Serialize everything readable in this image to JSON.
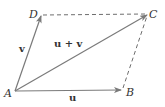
{
  "diagram": {
    "colors": {
      "vector": "#7a7a7a",
      "dashed": "#6e6e6e",
      "text": "#333333",
      "background": "#ffffff"
    },
    "points": {
      "A": {
        "label": "A",
        "x": 15,
        "y": 91
      },
      "B": {
        "label": "B",
        "x": 122,
        "y": 90
      },
      "C": {
        "label": "C",
        "x": 148,
        "y": 14
      },
      "D": {
        "label": "D",
        "x": 41,
        "y": 15
      }
    },
    "vectors": [
      {
        "name": "u",
        "label": "u",
        "from": "A",
        "to": "B",
        "style": "solid-arrow"
      },
      {
        "name": "v",
        "label": "v",
        "from": "A",
        "to": "D",
        "style": "solid-arrow"
      },
      {
        "name": "u+v",
        "label": "u + v",
        "from": "A",
        "to": "C",
        "style": "solid-arrow"
      }
    ],
    "dashed_edges": [
      {
        "from": "D",
        "to": "C"
      },
      {
        "from": "B",
        "to": "C"
      }
    ],
    "labels": {
      "point_A": "A",
      "point_B": "B",
      "point_C": "C",
      "point_D": "D",
      "vector_u": "u",
      "vector_v": "v",
      "vector_sum": "u + v"
    }
  }
}
